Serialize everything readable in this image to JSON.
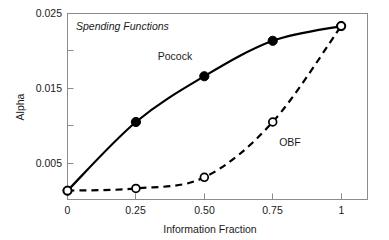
{
  "chart_data": {
    "type": "line",
    "title": "",
    "annotation": "Spending Functions",
    "xlabel": "Information Fraction",
    "ylabel": "Alpha",
    "xlim": [
      0,
      1.1
    ],
    "ylim": [
      0,
      0.0252
    ],
    "grid": false,
    "legend_position": "inline-annotations",
    "x_ticks": [
      {
        "value": 0,
        "label": "0"
      },
      {
        "value": 0.25,
        "label": "0.25"
      },
      {
        "value": 0.5,
        "label": "0.50"
      },
      {
        "value": 0.75,
        "label": "0.75"
      },
      {
        "value": 1,
        "label": "1"
      }
    ],
    "y_ticks": [
      {
        "value": 0.005,
        "label": "0.005",
        "minor": false
      },
      {
        "value": 0.01,
        "label": "",
        "minor": true
      },
      {
        "value": 0.015,
        "label": "0.015",
        "minor": false
      },
      {
        "value": 0.02,
        "label": "",
        "minor": true
      },
      {
        "value": 0.025,
        "label": "0.025",
        "minor": false
      }
    ],
    "x": [
      0,
      0.25,
      0.5,
      0.75,
      1
    ],
    "series": [
      {
        "name": "Pocock",
        "label": "Pocock",
        "style": "solid",
        "marker": "filled-circle",
        "color": "#000000",
        "values": [
          0.0012,
          0.0105,
          0.0167,
          0.0215,
          0.0235
        ]
      },
      {
        "name": "OBF",
        "label": "OBF",
        "style": "dashed",
        "marker": "open-circle",
        "color": "#000000",
        "values": [
          0.0012,
          0.0015,
          0.003,
          0.0105,
          0.0235
        ]
      }
    ]
  },
  "labels": {
    "pocock": "Pocock",
    "obf": "OBF",
    "note": "Spending Functions",
    "xlabel": "Information Fraction",
    "ylabel": "Alpha",
    "ytick_025": "0.025",
    "ytick_015": "0.015",
    "ytick_005": "0.005",
    "xtick_0": "0",
    "xtick_025": "0.25",
    "xtick_050": "0.50",
    "xtick_075": "0.75",
    "xtick_1": "1"
  },
  "colors": {
    "ink": "#000000",
    "frame": "#8c8c8c",
    "background": "#ffffff"
  }
}
